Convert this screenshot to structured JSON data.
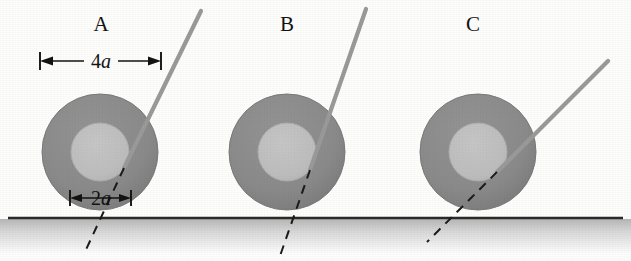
{
  "figure": {
    "type": "physics-diagram",
    "width": 631,
    "height": 261,
    "background_color": "#fdfdfc"
  },
  "colors": {
    "outer_ring": "#8a8a8a",
    "outer_ring_edge": "#787878",
    "inner_hub": "#bdbdbd",
    "inner_hub_edge": "#b0b0b0",
    "string": "#9a9a9a",
    "dashed_line": "#1b1b1b",
    "ground_line": "#2a2a2a",
    "ground_fill_top": "#b9b9b9",
    "ground_fill_bottom": "#fbfbfb",
    "text": "#131313"
  },
  "ground": {
    "name": "ground-surface",
    "y": 218,
    "x_start": 8,
    "x_end": 623,
    "line_width": 2.4,
    "shading_height": 34
  },
  "dimensions": {
    "outer_diameter": {
      "label_prefix": "4",
      "label_variable": "a",
      "label_full": "4a",
      "x_start": 40,
      "x_end": 161,
      "y": 61
    },
    "inner_diameter": {
      "label_prefix": "2",
      "label_variable": "a",
      "label_full": "2a",
      "x_start": 70,
      "x_end": 131,
      "y": 198
    }
  },
  "geometry": {
    "outer_radius": 58,
    "inner_radius": 29,
    "center_y": 152,
    "string_width": 4.2,
    "dash_pattern": "9 7",
    "dash_width": 2.0
  },
  "wheels": [
    {
      "id": "A",
      "label": "A",
      "label_x": 101,
      "label_y": 31,
      "center_x": 100,
      "center_y": 152,
      "outer_radius": 58,
      "inner_radius": 29,
      "string": {
        "name": "string-a",
        "tangent_x": 124,
        "tangent_y": 168,
        "top_x": 201,
        "top_y": 11,
        "angle_deg": 64
      },
      "dashed_extension": {
        "name": "dashed-line-a",
        "from_x": 124,
        "from_y": 168,
        "to_x": 84,
        "to_y": 254
      }
    },
    {
      "id": "B",
      "label": "B",
      "label_x": 287,
      "label_y": 31,
      "center_x": 287,
      "center_y": 152,
      "outer_radius": 58,
      "inner_radius": 29,
      "string": {
        "name": "string-b",
        "tangent_x": 310,
        "tangent_y": 170,
        "top_x": 366,
        "top_y": 9,
        "angle_deg": 71
      },
      "dashed_extension": {
        "name": "dashed-line-b",
        "from_x": 310,
        "from_y": 170,
        "to_x": 280,
        "to_y": 256
      }
    },
    {
      "id": "C",
      "label": "C",
      "label_x": 473,
      "label_y": 31,
      "center_x": 478,
      "center_y": 152,
      "outer_radius": 58,
      "inner_radius": 29,
      "string": {
        "name": "string-c",
        "tangent_x": 497,
        "tangent_y": 172,
        "top_x": 608,
        "top_y": 61,
        "angle_deg": 45
      },
      "dashed_extension": {
        "name": "dashed-line-c",
        "from_x": 497,
        "from_y": 172,
        "to_x": 427,
        "to_y": 242
      }
    }
  ]
}
